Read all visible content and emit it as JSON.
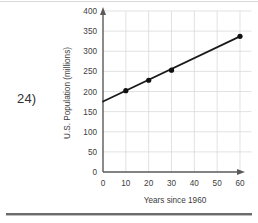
{
  "worksheet": {
    "problem_number": "24)"
  },
  "chart_data": {
    "type": "line",
    "title": "",
    "subtitle": "",
    "xlabel": "Years since 1960",
    "ylabel": "U.S. Population (millions)",
    "xlim": [
      0,
      65
    ],
    "ylim": [
      0,
      400
    ],
    "xticks": [
      0,
      10,
      20,
      30,
      40,
      50,
      60
    ],
    "xtick_labels": [
      "0",
      "10",
      "20",
      "30",
      "40",
      "50",
      "60"
    ],
    "yticks": [
      0,
      50,
      100,
      150,
      200,
      250,
      300,
      350,
      400
    ],
    "ytick_labels": [
      "0",
      "50",
      "100",
      "150",
      "200",
      "250",
      "300",
      "350",
      "400"
    ],
    "grid": true,
    "grid_axis": "both",
    "legend": false,
    "legend_position": "none",
    "line_color": "#111111",
    "marker_color": "#111111",
    "grid_color": "#d6d6d6",
    "axis_color": "#5a5a5a",
    "trend_start": {
      "x": 0,
      "y": 175
    },
    "trend_end": {
      "x": 60,
      "y": 337
    },
    "series": [
      {
        "name": "U.S. Population",
        "x": [
          10,
          20,
          30,
          60
        ],
        "values": [
          202,
          228,
          253,
          337
        ]
      }
    ],
    "annotations": []
  }
}
